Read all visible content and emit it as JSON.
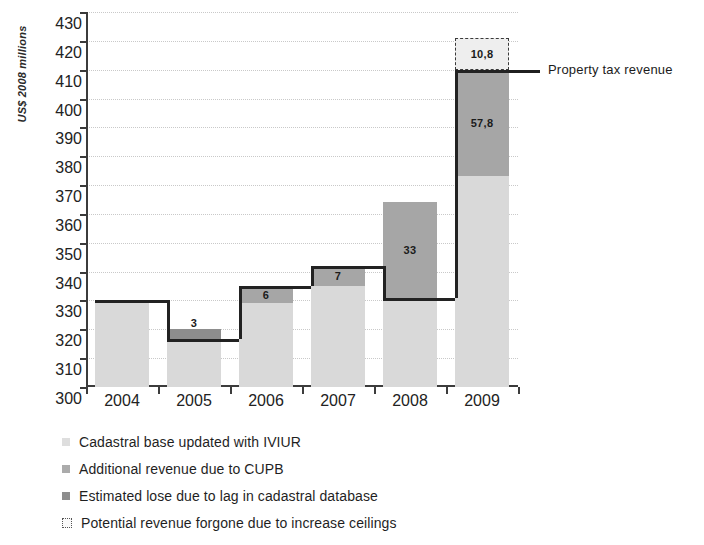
{
  "chart_data": {
    "type": "bar",
    "subtype": "waterfall",
    "title": "",
    "xlabel": "",
    "ylabel": "US$ 2008 millions",
    "categories": [
      "2004",
      "2005",
      "2006",
      "2007",
      "2008",
      "2009"
    ],
    "ylim": [
      300,
      430
    ],
    "ytick_step": 10,
    "yticks": [
      300,
      310,
      320,
      330,
      340,
      350,
      360,
      370,
      380,
      390,
      400,
      410,
      420,
      430
    ],
    "grid": true,
    "legend_position": "bottom-left",
    "revenue_line": [
      330,
      316.5,
      335,
      342,
      331,
      410
    ],
    "segments": [
      {
        "category": "2004",
        "base_bottom": 300,
        "base_top": 330,
        "label": "",
        "series": "Cadastral base updated with IVIUR"
      },
      {
        "category": "2005",
        "base_bottom": 300,
        "base_top": 316.5,
        "loss_bottom": 316.5,
        "loss_top": 320,
        "label": "3",
        "series": "Estimated lose due to lag in cadastral database"
      },
      {
        "category": "2006",
        "base_bottom": 300,
        "base_top": 329,
        "increment_bottom": 329,
        "increment_top": 335,
        "label": "6",
        "series": "Additional revenue due to CUPB"
      },
      {
        "category": "2007",
        "base_bottom": 300,
        "base_top": 335,
        "increment_bottom": 335,
        "increment_top": 342,
        "label": "7",
        "series": "Additional revenue due to CUPB"
      },
      {
        "category": "2008",
        "base_bottom": 300,
        "base_top": 331,
        "increment_bottom": 331,
        "increment_top": 364,
        "label": "33",
        "series": "Additional revenue due to CUPB"
      },
      {
        "category": "2009",
        "base_bottom": 300,
        "base_top": 373,
        "increment_bottom": 373,
        "increment_top": 410,
        "label": "57,8",
        "forgone_bottom": 410,
        "forgone_top": 421,
        "forgone_label": "10,8",
        "series": "Additional revenue due to CUPB"
      }
    ],
    "annotations": [
      {
        "text": "Property tax revenue",
        "value": 410,
        "category": "2009"
      }
    ],
    "legend": [
      {
        "label": "Cadastral base updated with IVIUR",
        "swatch": "base",
        "color": "#dedede"
      },
      {
        "label": "Additional revenue due to CUPB",
        "swatch": "increment",
        "color": "#ababab"
      },
      {
        "label": "Estimated lose due to lag in cadastral database",
        "swatch": "loss",
        "color": "#8d8d8d"
      },
      {
        "label": "Potential revenue forgone due to increase ceilings",
        "swatch": "forgone",
        "color": "#fafafa"
      }
    ]
  }
}
